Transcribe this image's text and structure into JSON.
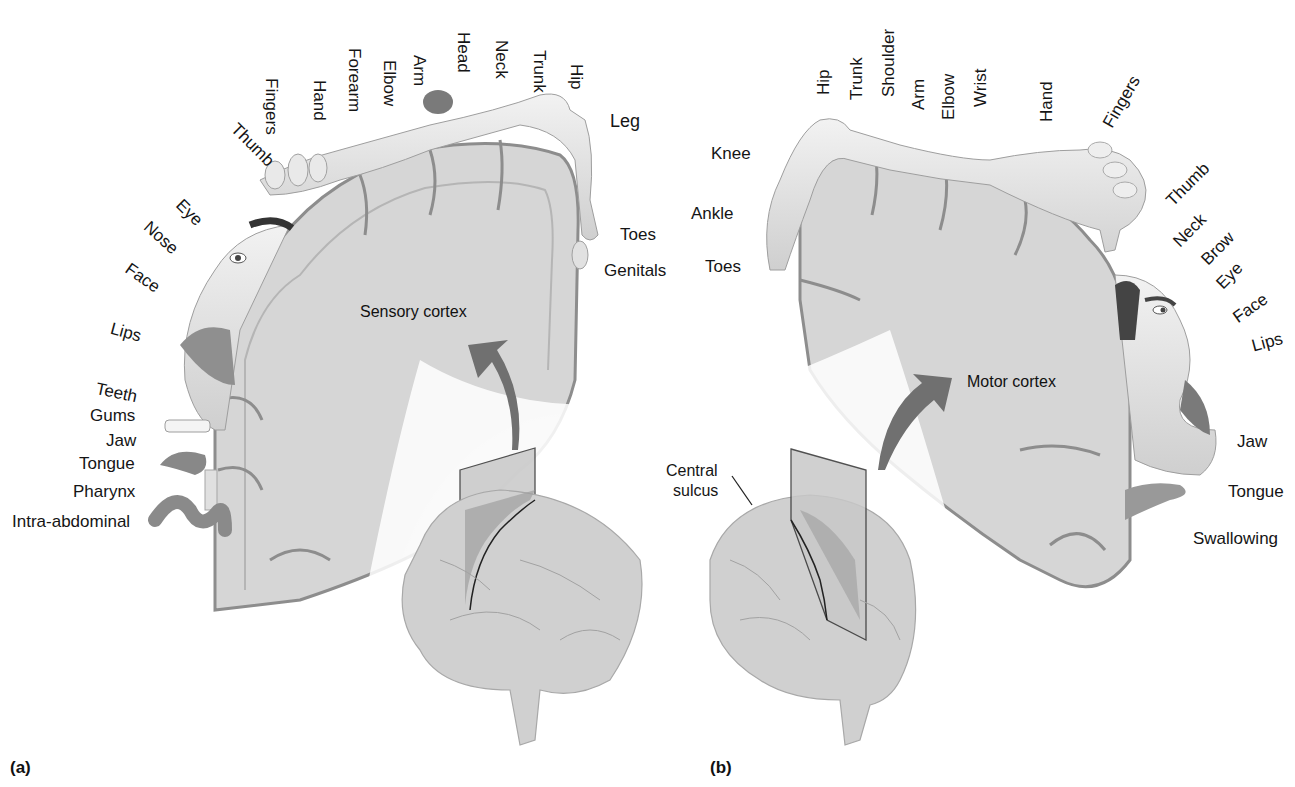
{
  "figure": {
    "panel_a": {
      "tag": "(a)",
      "title": "Sensory cortex",
      "labels": {
        "thumb": "Thumb",
        "fingers": "Fingers",
        "hand": "Hand",
        "forearm": "Forearm",
        "elbow": "Elbow",
        "arm": "Arm",
        "head": "Head",
        "neck": "Neck",
        "trunk": "Trunk",
        "hip": "Hip",
        "leg": "Leg",
        "toes": "Toes",
        "genitals": "Genitals",
        "eye": "Eye",
        "nose": "Nose",
        "face": "Face",
        "lips": "Lips",
        "teeth": "Teeth",
        "gums": "Gums",
        "jaw": "Jaw",
        "tongue": "Tongue",
        "pharynx": "Pharynx",
        "intra_abdominal": "Intra-abdominal"
      }
    },
    "panel_b": {
      "tag": "(b)",
      "title": "Motor cortex",
      "central_sulcus": "Central\nsulcus",
      "central_line1": "Central",
      "central_line2": "sulcus",
      "labels": {
        "knee": "Knee",
        "ankle": "Ankle",
        "toes": "Toes",
        "hip": "Hip",
        "trunk": "Trunk",
        "shoulder": "Shoulder",
        "arm": "Arm",
        "elbow": "Elbow",
        "wrist": "Wrist",
        "hand": "Hand",
        "fingers": "Fingers",
        "thumb": "Thumb",
        "neck": "Neck",
        "brow": "Brow",
        "eye": "Eye",
        "face": "Face",
        "lips": "Lips",
        "jaw": "Jaw",
        "tongue": "Tongue",
        "swallowing": "Swallowing"
      }
    },
    "colors": {
      "cortex_fill": "#d9d9d9",
      "cortex_inner": "#e6e6e6",
      "cortex_outline": "#8a8a8a",
      "body_fill": "#e8e8e8",
      "arrow": "#6f6f6f",
      "plane": "#bdbdbd",
      "brain": "#d0d0d0"
    }
  }
}
